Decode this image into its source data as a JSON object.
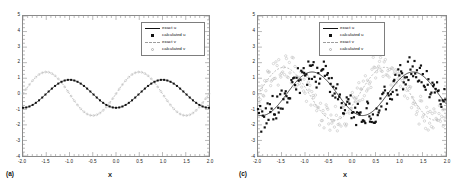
{
  "figure": {
    "panels": [
      {
        "panel_label": "(a)",
        "legend": [
          {
            "label": "exact u",
            "key": "solid-line"
          },
          {
            "label": "calculated u",
            "key": "filled-square"
          },
          {
            "label": "exact v",
            "key": "dashed-line"
          },
          {
            "label": "calculated v",
            "key": "open-circle"
          }
        ]
      },
      {
        "panel_label": "(c)",
        "legend": [
          {
            "label": "exact u",
            "key": "solid-line"
          },
          {
            "label": "calculated u",
            "key": "filled-square"
          },
          {
            "label": "exact v",
            "key": "dashed-line"
          },
          {
            "label": "calculated v",
            "key": "open-circle"
          }
        ]
      }
    ]
  },
  "colors": {
    "u_exact": "#111111",
    "u_calculated": "#111111",
    "v_exact": "#9d9d9d",
    "v_calculated": "#bcbcbc",
    "frame": "#8a8a8a",
    "background": "#ffffff"
  },
  "chart_data": [
    {
      "type": "line",
      "title": "",
      "panel_label": "(a)",
      "xlabel": "X",
      "ylabel": "",
      "xlim": [
        -2.0,
        2.0
      ],
      "ylim": [
        -4,
        5
      ],
      "xticks": [
        -2.0,
        -1.5,
        -1.0,
        -0.5,
        0.0,
        0.5,
        1.0,
        1.5,
        2.0
      ],
      "xtick_labels": [
        "-2.0",
        "-1.5",
        "-1.0",
        "-0.5",
        "0.0",
        "0.5",
        "1.0",
        "1.5",
        "2.0"
      ],
      "yticks": [
        -4,
        -3,
        -2,
        -1,
        0,
        1,
        2,
        3,
        4,
        5
      ],
      "ytick_labels": [
        "-4",
        "-3",
        "-2",
        "-1",
        "0",
        "1",
        "2",
        "3",
        "4",
        "5"
      ],
      "grid": false,
      "minor_ticks": true,
      "legend_position": "upper-right",
      "series": [
        {
          "name": "exact u",
          "style": "solid-line",
          "color": "#111111",
          "form": "amplitude 0.9 cosine, period 2.0, peaks at x=-1.0 and x=1.0, troughs at x=-2.0, x=0.0, x=2.0",
          "amplitude": 0.9,
          "period": 2.0,
          "phase_peak_x": -1.0,
          "offset": 0.0,
          "x": [
            -2.0,
            -1.9,
            -1.8,
            -1.7,
            -1.6,
            -1.5,
            -1.4,
            -1.3,
            -1.2,
            -1.1,
            -1.0,
            -0.9,
            -0.8,
            -0.7,
            -0.6,
            -0.5,
            -0.4,
            -0.3,
            -0.2,
            -0.1,
            0.0,
            0.1,
            0.2,
            0.3,
            0.4,
            0.5,
            0.6,
            0.7,
            0.8,
            0.9,
            1.0,
            1.1,
            1.2,
            1.3,
            1.4,
            1.5,
            1.6,
            1.7,
            1.8,
            1.9,
            2.0
          ],
          "y": [
            -0.9,
            -0.86,
            -0.73,
            -0.53,
            -0.28,
            0.0,
            0.28,
            0.53,
            0.73,
            0.86,
            0.9,
            0.86,
            0.73,
            0.53,
            0.28,
            0.0,
            -0.28,
            -0.53,
            -0.73,
            -0.86,
            -0.9,
            -0.86,
            -0.73,
            -0.53,
            -0.28,
            0.0,
            0.28,
            0.53,
            0.73,
            0.86,
            0.9,
            0.86,
            0.73,
            0.53,
            0.28,
            0.0,
            -0.28,
            -0.53,
            -0.73,
            -0.86,
            -0.9
          ]
        },
        {
          "name": "calculated u",
          "style": "filled-square-markers",
          "color": "#111111",
          "form": "markers lying on the exact u curve (no visible deviation)",
          "x": [
            -2.0,
            -1.9,
            -1.8,
            -1.7,
            -1.6,
            -1.5,
            -1.4,
            -1.3,
            -1.2,
            -1.1,
            -1.0,
            -0.9,
            -0.8,
            -0.7,
            -0.6,
            -0.5,
            -0.4,
            -0.3,
            -0.2,
            -0.1,
            0.0,
            0.1,
            0.2,
            0.3,
            0.4,
            0.5,
            0.6,
            0.7,
            0.8,
            0.9,
            1.0,
            1.1,
            1.2,
            1.3,
            1.4,
            1.5,
            1.6,
            1.7,
            1.8,
            1.9,
            2.0
          ],
          "y": [
            -0.9,
            -0.86,
            -0.73,
            -0.53,
            -0.28,
            0.0,
            0.28,
            0.53,
            0.73,
            0.86,
            0.9,
            0.86,
            0.73,
            0.53,
            0.28,
            0.0,
            -0.28,
            -0.53,
            -0.73,
            -0.86,
            -0.9,
            -0.86,
            -0.73,
            -0.53,
            -0.28,
            0.0,
            0.28,
            0.53,
            0.73,
            0.86,
            0.9,
            0.86,
            0.73,
            0.53,
            0.28,
            0.0,
            -0.28,
            -0.53,
            -0.73,
            -0.86,
            -0.9
          ]
        },
        {
          "name": "exact v",
          "style": "dashed-line",
          "color": "#9d9d9d",
          "form": "amplitude 1.4 cosine, period 2.0, peaks at x=-1.5 and x=0.5, troughs at x=-0.5 and x=1.5",
          "amplitude": 1.4,
          "period": 2.0,
          "phase_peak_x": -1.5,
          "offset": 0.0,
          "x": [
            -2.0,
            -1.9,
            -1.8,
            -1.7,
            -1.6,
            -1.5,
            -1.4,
            -1.3,
            -1.2,
            -1.1,
            -1.0,
            -0.9,
            -0.8,
            -0.7,
            -0.6,
            -0.5,
            -0.4,
            -0.3,
            -0.2,
            -0.1,
            0.0,
            0.1,
            0.2,
            0.3,
            0.4,
            0.5,
            0.6,
            0.7,
            0.8,
            0.9,
            1.0,
            1.1,
            1.2,
            1.3,
            1.4,
            1.5,
            1.6,
            1.7,
            1.8,
            1.9,
            2.0
          ],
          "y": [
            0.0,
            0.43,
            0.82,
            1.13,
            1.33,
            1.4,
            1.33,
            1.13,
            0.82,
            0.43,
            0.0,
            -0.43,
            -0.82,
            -1.13,
            -1.33,
            -1.4,
            -1.33,
            -1.13,
            -0.82,
            -0.43,
            0.0,
            0.43,
            0.82,
            1.13,
            1.33,
            1.4,
            1.33,
            1.13,
            0.82,
            0.43,
            0.0,
            -0.43,
            -0.82,
            -1.13,
            -1.33,
            -1.4,
            -1.33,
            -1.13,
            -0.82,
            -0.43,
            0.0
          ]
        },
        {
          "name": "calculated v",
          "style": "open-circle-markers",
          "color": "#bcbcbc",
          "form": "markers lying on the exact v curve (no visible deviation)",
          "x": [
            -2.0,
            -1.9,
            -1.8,
            -1.7,
            -1.6,
            -1.5,
            -1.4,
            -1.3,
            -1.2,
            -1.1,
            -1.0,
            -0.9,
            -0.8,
            -0.7,
            -0.6,
            -0.5,
            -0.4,
            -0.3,
            -0.2,
            -0.1,
            0.0,
            0.1,
            0.2,
            0.3,
            0.4,
            0.5,
            0.6,
            0.7,
            0.8,
            0.9,
            1.0,
            1.1,
            1.2,
            1.3,
            1.4,
            1.5,
            1.6,
            1.7,
            1.8,
            1.9,
            2.0
          ],
          "y": [
            0.0,
            0.43,
            0.82,
            1.13,
            1.33,
            1.4,
            1.33,
            1.13,
            0.82,
            0.43,
            0.0,
            -0.43,
            -0.82,
            -1.13,
            -1.33,
            -1.4,
            -1.33,
            -1.13,
            -0.82,
            -0.43,
            0.0,
            0.43,
            0.82,
            1.13,
            1.33,
            1.4,
            1.33,
            1.13,
            0.82,
            0.43,
            0.0,
            -0.43,
            -0.82,
            -1.13,
            -1.33,
            -1.4,
            -1.33,
            -1.13,
            -0.82,
            -0.43,
            0.0
          ]
        }
      ]
    },
    {
      "type": "scatter",
      "title": "",
      "panel_label": "(c)",
      "xlabel": "X",
      "ylabel": "",
      "xlim": [
        -2.0,
        2.0
      ],
      "ylim": [
        -4,
        5
      ],
      "xticks": [
        -2.0,
        -1.5,
        -1.0,
        -0.5,
        0.0,
        0.5,
        1.0,
        1.5,
        2.0
      ],
      "xtick_labels": [
        "-2.0",
        "-1.5",
        "-1.0",
        "-0.5",
        "0.0",
        "0.5",
        "1.0",
        "1.5",
        "2.0"
      ],
      "yticks": [
        -4,
        -3,
        -2,
        -1,
        0,
        1,
        2,
        3,
        4,
        5
      ],
      "ytick_labels": [
        "-4",
        "-3",
        "-2",
        "-1",
        "0",
        "1",
        "2",
        "3",
        "4",
        "5"
      ],
      "grid": false,
      "minor_ticks": true,
      "legend_position": "upper-right",
      "noise_amplitude": 0.9,
      "series": [
        {
          "name": "exact u",
          "style": "solid-line",
          "color": "#111111",
          "form": "amplitude 1.4 cosine, period 2.0, peaks near x=-0.85 and x=1.2",
          "amplitude": 1.4,
          "period": 2.15,
          "phase_peak_x": -0.85,
          "offset": 0.0
        },
        {
          "name": "calculated u",
          "style": "filled-square-markers",
          "color": "#111111",
          "form": "noisy scatter about the exact u curve, spread roughly +/-0.9",
          "scatter_spread": 0.9,
          "n_points": 200
        },
        {
          "name": "exact v",
          "style": "dashed-line",
          "color": "#9d9d9d",
          "form": "amplitude 1.7 cosine, period 2.15, peaks near x=-1.45 and x=0.7",
          "amplitude": 1.7,
          "period": 2.15,
          "phase_peak_x": -1.45,
          "offset": 0.0
        },
        {
          "name": "calculated v",
          "style": "open-circle-markers",
          "color": "#bcbcbc",
          "form": "noisy scatter about the exact v curve, spread roughly +/-0.9",
          "scatter_spread": 0.9,
          "n_points": 200
        }
      ]
    }
  ]
}
